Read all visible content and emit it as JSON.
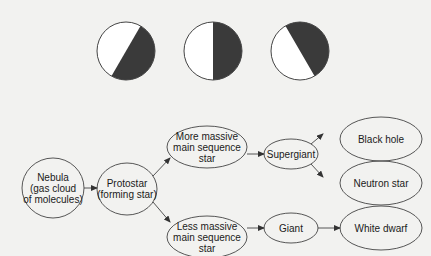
{
  "colors": {
    "background": "#f2f2f0",
    "stroke": "#444444",
    "fill_dark": "#3a3a3a",
    "fill_light": "#ffffff",
    "text": "#1a1a1a"
  },
  "circles": [
    {
      "id": "circle-1",
      "cx": 126,
      "cy": 51,
      "r": 29,
      "dark_side": "right",
      "divider_angle_deg": 30
    },
    {
      "id": "circle-2",
      "cx": 213,
      "cy": 51,
      "r": 29,
      "dark_side": "right",
      "divider_angle_deg": 0
    },
    {
      "id": "circle-3",
      "cx": 300,
      "cy": 51,
      "r": 29,
      "dark_side": "right",
      "divider_angle_deg": -30
    }
  ],
  "flowchart": {
    "nodes": [
      {
        "id": "nebula",
        "label": "Nebula\n(gas cloud\nof molecules)",
        "cx": 53,
        "cy": 188,
        "rx": 31,
        "ry": 30
      },
      {
        "id": "protostar",
        "label": "Protostar\n(forming star)",
        "cx": 127,
        "cy": 189,
        "rx": 30,
        "ry": 26
      },
      {
        "id": "more-massive",
        "label": "More massive\nmain sequence\nstar",
        "cx": 207,
        "cy": 147,
        "rx": 40,
        "ry": 21
      },
      {
        "id": "less-massive",
        "label": "Less massive\nmain sequence\nstar",
        "cx": 207,
        "cy": 237,
        "rx": 40,
        "ry": 21
      },
      {
        "id": "supergiant",
        "label": "Supergiant",
        "cx": 291,
        "cy": 154,
        "rx": 27,
        "ry": 15
      },
      {
        "id": "giant",
        "label": "Giant",
        "cx": 291,
        "cy": 228,
        "rx": 27,
        "ry": 15
      },
      {
        "id": "black-hole",
        "label": "Black hole",
        "cx": 381,
        "cy": 139,
        "rx": 41,
        "ry": 22
      },
      {
        "id": "neutron-star",
        "label": "Neutron star",
        "cx": 381,
        "cy": 183,
        "rx": 41,
        "ry": 22
      },
      {
        "id": "white-dwarf",
        "label": "White dwarf",
        "cx": 381,
        "cy": 228,
        "rx": 41,
        "ry": 22
      }
    ],
    "edges": [
      {
        "from": "nebula",
        "to": "protostar",
        "x1": 84,
        "y1": 188,
        "x2": 97,
        "y2": 188
      },
      {
        "from": "protostar",
        "to": "more-massive",
        "x1": 153,
        "y1": 176,
        "x2": 170,
        "y2": 158
      },
      {
        "from": "protostar",
        "to": "less-massive",
        "x1": 153,
        "y1": 202,
        "x2": 170,
        "y2": 222
      },
      {
        "from": "more-massive",
        "to": "supergiant",
        "x1": 247,
        "y1": 154,
        "x2": 264,
        "y2": 154
      },
      {
        "from": "less-massive",
        "to": "giant",
        "x1": 247,
        "y1": 228,
        "x2": 264,
        "y2": 228
      },
      {
        "from": "supergiant",
        "to": "black-hole",
        "x1": 311,
        "y1": 144,
        "x2": 323,
        "y2": 134
      },
      {
        "from": "supergiant",
        "to": "neutron-star",
        "x1": 311,
        "y1": 164,
        "x2": 323,
        "y2": 177
      },
      {
        "from": "giant",
        "to": "white-dwarf",
        "x1": 318,
        "y1": 228,
        "x2": 340,
        "y2": 228
      }
    ]
  }
}
